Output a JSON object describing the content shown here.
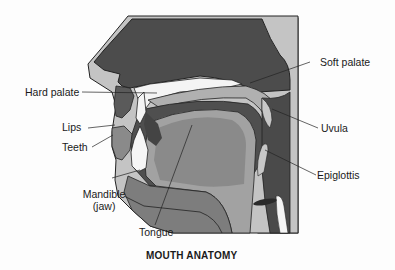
{
  "diagram": {
    "title": "MOUTH ANATOMY",
    "style": "greyscale sagittal cross-section",
    "colors": {
      "background": "#fdfdfd",
      "dark_tissue": "#4a4a4a",
      "mid_tissue": "#7a7a7a",
      "light_tissue": "#a9a9a9",
      "outline_band": "#c4c4c4",
      "bone_white": "#f4f4f4",
      "line": "#222222"
    },
    "labels": [
      {
        "id": "hard-palate",
        "text": "Hard palate"
      },
      {
        "id": "soft-palate",
        "text": "Soft palate"
      },
      {
        "id": "lips",
        "text": "Lips"
      },
      {
        "id": "teeth",
        "text": "Teeth"
      },
      {
        "id": "uvula",
        "text": "Uvula"
      },
      {
        "id": "epiglottis",
        "text": "Epiglottis"
      },
      {
        "id": "mandible",
        "text": "Mandible",
        "subtext": "(jaw)"
      },
      {
        "id": "tongue",
        "text": "Tongue"
      }
    ]
  }
}
